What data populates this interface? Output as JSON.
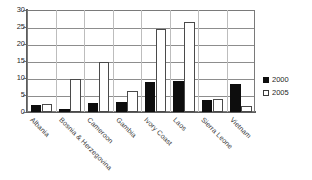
{
  "chart_data": {
    "type": "bar",
    "title": "",
    "subtitle": "",
    "xlabel": "",
    "ylabel": "",
    "ylim": [
      0,
      30
    ],
    "yticks": [
      0,
      5,
      10,
      15,
      20,
      25,
      30
    ],
    "grid": true,
    "legend_position": "right",
    "categories": [
      "Albania",
      "Bosnia & Herzegovina",
      "Cameroon",
      "Gambia",
      "Ivory Coast",
      "Laos",
      "Sierra Leone",
      "Vietnam"
    ],
    "series": [
      {
        "name": "2000",
        "color": "#0d0d0d",
        "values": [
          2.0,
          0.8,
          2.7,
          2.8,
          8.8,
          9.1,
          3.6,
          8.3
        ]
      },
      {
        "name": "2005",
        "color": "#ffffff",
        "values": [
          2.3,
          9.8,
          14.7,
          6.1,
          24.4,
          26.4,
          3.8,
          1.8
        ]
      }
    ]
  },
  "legend": {
    "entries": [
      {
        "label": "2000",
        "swatch": "filled-square-icon"
      },
      {
        "label": "2005",
        "swatch": "outlined-square-icon"
      }
    ]
  }
}
